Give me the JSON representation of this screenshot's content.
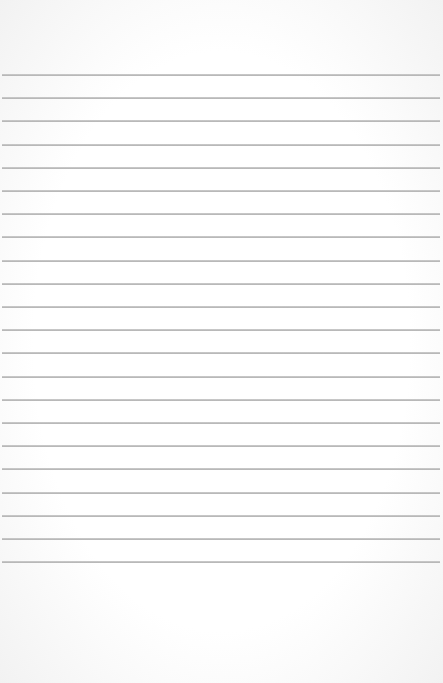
{
  "paper": {
    "type": "lined-paper",
    "background_color": "#ffffff",
    "line_color": "#aaaaaa",
    "line_count": 22,
    "first_line_y": 74,
    "line_spacing": 23.2
  }
}
